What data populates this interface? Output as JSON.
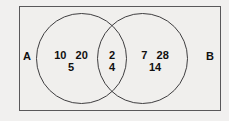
{
  "diagram": {
    "type": "venn-two-set",
    "background_color": "#f1f0ef",
    "outline_color": "#3f3e40",
    "rect_border_color": "#59585a",
    "text_color": "#101010",
    "sets": [
      {
        "id": "A",
        "label": "A",
        "label_position": "outside-left"
      },
      {
        "id": "B",
        "label": "B",
        "label_position": "outside-right"
      }
    ],
    "regions": {
      "a_only": {
        "name": "A only",
        "row_top": "10   20",
        "row_bottom": "5",
        "values": [
          10,
          20,
          5
        ]
      },
      "intersection": {
        "name": "A and B",
        "row_top": "2",
        "row_bottom": "4",
        "values": [
          2,
          4
        ]
      },
      "b_only": {
        "name": "B only",
        "row_top": "7   28",
        "row_bottom": "14",
        "values": [
          7,
          28,
          14
        ]
      }
    }
  }
}
